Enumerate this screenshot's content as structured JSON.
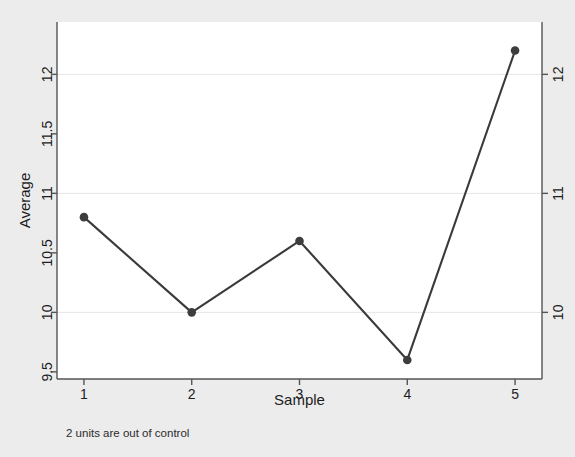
{
  "chart_data": {
    "type": "line",
    "title": "",
    "subtitle": "",
    "xlabel": "Sample",
    "ylabel": "Average",
    "x": [
      1,
      2,
      3,
      4,
      5
    ],
    "values": [
      10.8,
      10.0,
      10.6,
      9.6,
      12.2
    ],
    "series": [
      {
        "name": "Average",
        "values": [
          10.8,
          10.0,
          10.6,
          9.6,
          12.2
        ]
      }
    ],
    "xlim": [
      0.75,
      5.25
    ],
    "ylim": [
      9.44,
      12.44
    ],
    "xticks": [
      "1",
      "2",
      "3",
      "4",
      "5"
    ],
    "xtick_values": [
      1,
      2,
      3,
      4,
      5
    ],
    "yticks_left": [
      "9.5",
      "10",
      "10.5",
      "11",
      "11.5",
      "12"
    ],
    "ytick_left_values": [
      9.5,
      10,
      10.5,
      11,
      11.5,
      12
    ],
    "yticks_right": [
      "10",
      "11",
      "12"
    ],
    "ytick_right_values": [
      10,
      11,
      12
    ],
    "gridlines": [
      "10",
      "11",
      "12"
    ],
    "gridline_values": [
      10,
      11,
      12
    ],
    "grid": true,
    "legend": "none",
    "annotation": "2 units are out of control",
    "marker": "filled-circle",
    "line_color": "#3a3a3a",
    "marker_color": "#3d3d3d",
    "grid_color": "#e6e6e8",
    "axis_color": "#555555",
    "panel_background": "#ffffff",
    "page_background": "#ececed"
  },
  "figure": {
    "caption": "2 units are out of control",
    "x_axis_label": "Sample",
    "y_axis_label": "Average"
  }
}
